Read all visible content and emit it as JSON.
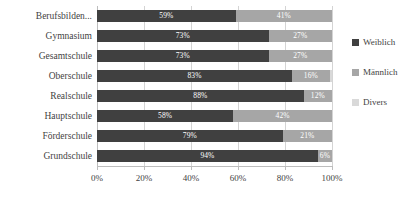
{
  "chart_data": {
    "type": "bar",
    "orientation": "horizontal",
    "stacked": true,
    "stack_mode": "percent",
    "title": "",
    "xlabel": "",
    "ylabel": "",
    "xlim": [
      0,
      100
    ],
    "xticks": [
      "0%",
      "20%",
      "40%",
      "60%",
      "80%",
      "100%"
    ],
    "xtick_values": [
      0,
      20,
      40,
      60,
      80,
      100
    ],
    "grid": true,
    "legend_position": "right",
    "categories": [
      "Berufsbilden...",
      "Gymnasium",
      "Gesamtschule",
      "Oberschule",
      "Realschule",
      "Hauptschule",
      "Förderschule",
      "Grundschule"
    ],
    "series": [
      {
        "name": "Weiblich",
        "color": "#404040",
        "values": [
          59,
          73,
          73,
          83,
          88,
          58,
          79,
          94
        ],
        "labels": [
          "59%",
          "73%",
          "73%",
          "83%",
          "88%",
          "58%",
          "79%",
          "94%"
        ]
      },
      {
        "name": "Männlich",
        "color": "#a6a6a6",
        "values": [
          41,
          27,
          27,
          16,
          12,
          42,
          21,
          6
        ],
        "labels": [
          "41%",
          "27%",
          "27%",
          "16%",
          "12%",
          "42%",
          "21%",
          "6%"
        ]
      },
      {
        "name": "Divers",
        "color": "#d9d9d9",
        "values": [
          0,
          0,
          0,
          1,
          0,
          0,
          0,
          0
        ],
        "labels": [
          "",
          "",
          "",
          "",
          "",
          "",
          "",
          ""
        ]
      }
    ]
  },
  "legend": {
    "items": [
      {
        "label": "Weiblich",
        "color": "#404040"
      },
      {
        "label": "Männlich",
        "color": "#a6a6a6"
      },
      {
        "label": "Divers",
        "color": "#d9d9d9"
      }
    ]
  }
}
